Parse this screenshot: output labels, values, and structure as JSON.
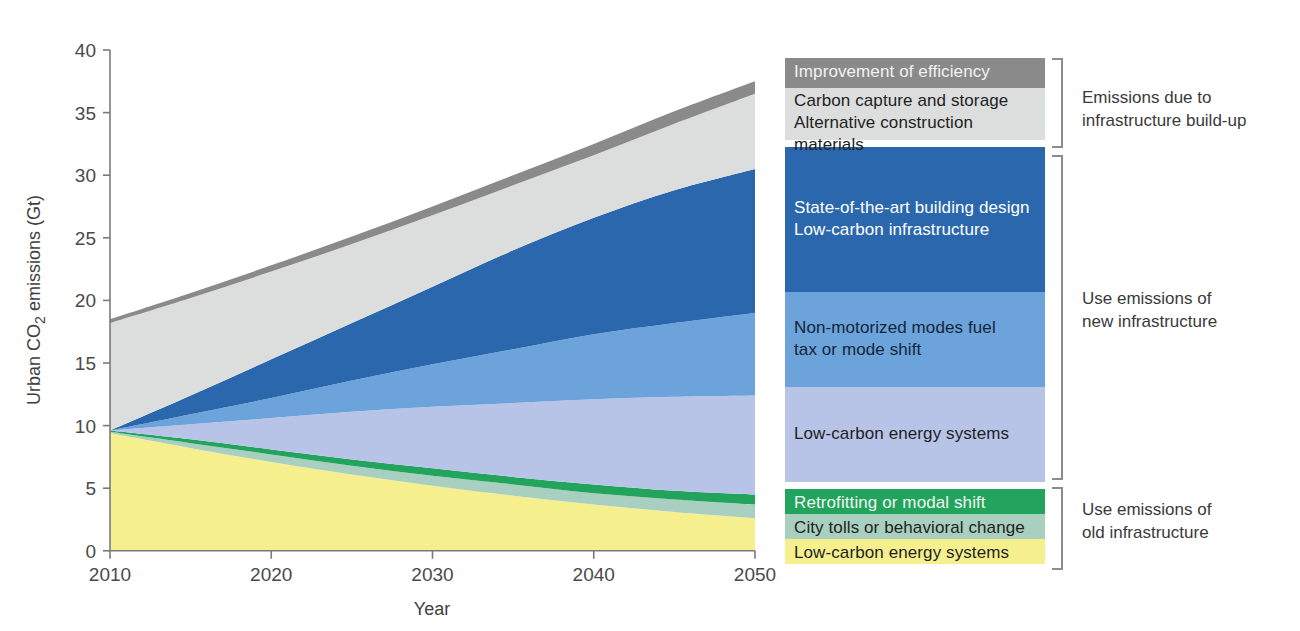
{
  "chart_data": {
    "type": "area",
    "stacked": true,
    "title": "",
    "xlabel": "Year",
    "ylabel": "Urban CO2 emissions (Gt)",
    "ylabel_display": "Urban CO₂ emissions (Gt)",
    "xlim": [
      2010,
      2050
    ],
    "ylim": [
      0,
      40
    ],
    "xticks": [
      2010,
      2020,
      2030,
      2040,
      2050
    ],
    "yticks": [
      0,
      5,
      10,
      15,
      20,
      25,
      30,
      35,
      40
    ],
    "grid": false,
    "legend_position": "right",
    "x": [
      2010,
      2015,
      2020,
      2025,
      2030,
      2035,
      2040,
      2045,
      2050
    ],
    "series": [
      {
        "name": "Low-carbon energy systems (old infrastructure)",
        "color": "#f6ef8e",
        "group": "old",
        "cumulative_top": [
          9.4,
          8.2,
          7.1,
          6.1,
          5.2,
          4.4,
          3.7,
          3.1,
          2.6
        ]
      },
      {
        "name": "City tolls or behavioral change",
        "color": "#a9cfc0",
        "group": "old",
        "cumulative_top": [
          9.5,
          8.6,
          7.7,
          6.8,
          6.0,
          5.3,
          4.6,
          4.1,
          3.7
        ]
      },
      {
        "name": "Retrofitting or modal shift",
        "color": "#22a45c",
        "group": "old",
        "cumulative_top": [
          9.6,
          8.9,
          8.1,
          7.3,
          6.6,
          5.9,
          5.3,
          4.8,
          4.5
        ]
      },
      {
        "name": "Low-carbon energy systems (new infrastructure)",
        "color": "#b7c4e8",
        "group": "new",
        "cumulative_top": [
          9.6,
          10.1,
          10.6,
          11.1,
          11.5,
          11.8,
          12.1,
          12.3,
          12.4
        ]
      },
      {
        "name": "Non-motorized modes fuel tax or mode shift",
        "color": "#6ba3da",
        "group": "new",
        "cumulative_top": [
          9.6,
          10.9,
          12.2,
          13.6,
          14.9,
          16.1,
          17.3,
          18.2,
          19.0
        ]
      },
      {
        "name": "State-of-the-art building design / Low-carbon infrastructure",
        "color": "#2a67ad",
        "group": "new",
        "cumulative_top": [
          9.6,
          12.4,
          15.3,
          18.2,
          21.1,
          24.0,
          26.6,
          28.8,
          30.5
        ]
      },
      {
        "name": "Carbon capture and storage / Alternative construction materials",
        "color": "#dcdedd",
        "group": "buildup",
        "cumulative_top": [
          18.2,
          20.2,
          22.3,
          24.5,
          26.8,
          29.2,
          31.6,
          34.1,
          36.5
        ]
      },
      {
        "name": "Improvement of efficiency",
        "color": "#8a8a8a",
        "group": "buildup",
        "cumulative_top": [
          18.5,
          20.6,
          22.8,
          25.1,
          27.5,
          30.0,
          32.5,
          35.1,
          37.5
        ]
      }
    ]
  },
  "axes": {
    "ylabel": "Urban CO₂ emissions (Gt)",
    "xlabel": "Year",
    "yticks": [
      "0",
      "5",
      "10",
      "15",
      "20",
      "25",
      "30",
      "35",
      "40"
    ],
    "xticks": [
      "2010",
      "2020",
      "2030",
      "2040",
      "2050"
    ]
  },
  "legend": {
    "groups": [
      {
        "id": "buildup",
        "annotation": "Emissions due to\ninfrastructure build-up",
        "rows": [
          {
            "label": "Improvement of efficiency",
            "color": "#8a8a8a",
            "text_color": "#f2f2f2"
          },
          {
            "label": "Carbon capture and storage\nAlternative construction materials",
            "color": "#dcdedd",
            "text_color": "#1f1f1f"
          }
        ]
      },
      {
        "id": "new",
        "annotation": "Use emissions of\nnew infrastructure",
        "rows": [
          {
            "label": "State-of-the-art building design\nLow-carbon infrastructure",
            "color": "#2a67ad",
            "text_color": "#ffffff"
          },
          {
            "label": "Non-motorized modes fuel\ntax or mode shift",
            "color": "#6ba3da",
            "text_color": "#14253b"
          },
          {
            "label": "Low-carbon energy systems",
            "color": "#b7c4e8",
            "text_color": "#1f1f1f"
          }
        ]
      },
      {
        "id": "old",
        "annotation": "Use emissions of\nold infrastructure",
        "rows": [
          {
            "label": "Retrofitting or modal shift",
            "color": "#22a45c",
            "text_color": "#f0f7f2"
          },
          {
            "label": "City tolls or behavioral change",
            "color": "#a9cfc0",
            "text_color": "#1f1f1f"
          },
          {
            "label": "Low-carbon energy systems",
            "color": "#f6ef8e",
            "text_color": "#1f1f1f"
          }
        ]
      }
    ]
  },
  "colors": {
    "axis": "#7a7a7a",
    "bracket": "#8c8c8c",
    "text": "#3a3a3a",
    "background": "#ffffff"
  }
}
